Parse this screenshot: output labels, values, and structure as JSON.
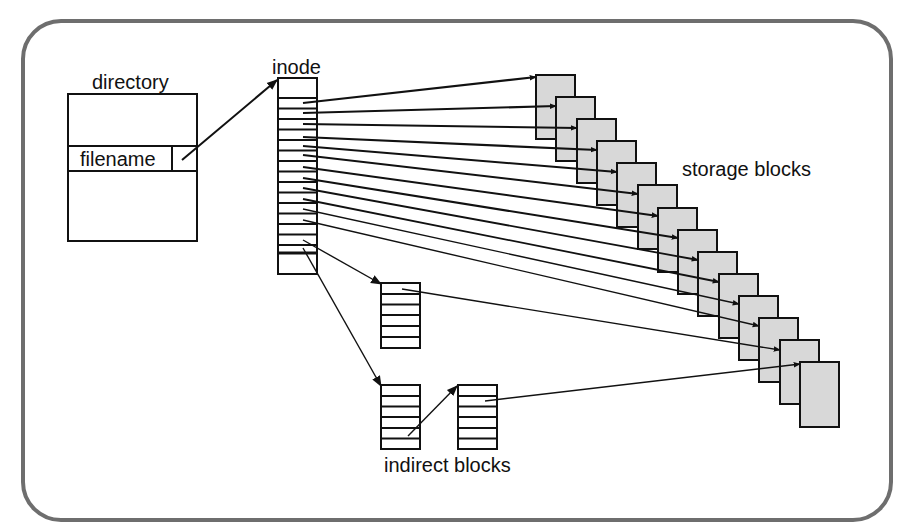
{
  "diagram": {
    "title": "",
    "labels": {
      "directory": "directory",
      "filename": "filename",
      "inode": "inode",
      "storage_blocks": "storage blocks",
      "indirect_blocks": "indirect blocks"
    },
    "colors": {
      "frame": "#6e6e6e",
      "stroke": "#111111",
      "block_fill": "#d8d8d8",
      "background": "#ffffff"
    },
    "structure": {
      "inode_direct_pointers": 14,
      "storage_block_count": 14,
      "single_indirect_rows": 6,
      "double_indirect_blocks": 2,
      "double_indirect_rows": 6
    }
  }
}
